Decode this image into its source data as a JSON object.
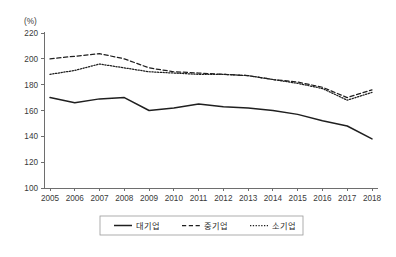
{
  "chart_data": {
    "type": "line",
    "title": "",
    "xlabel": "",
    "ylabel": "(%)",
    "unit_label": "(%)",
    "grid": false,
    "legend_position": "bottom",
    "ylim": [
      100,
      220
    ],
    "yticks": [
      100,
      120,
      140,
      160,
      180,
      200,
      220
    ],
    "ytick_labels": [
      "100",
      "120",
      "140",
      "160",
      "180",
      "200",
      "220"
    ],
    "x": [
      2005,
      2006,
      2007,
      2008,
      2009,
      2010,
      2011,
      2012,
      2013,
      2014,
      2015,
      2016,
      2017,
      2018
    ],
    "xtick_labels": [
      "2005",
      "2006",
      "2007",
      "2008",
      "2009",
      "2010",
      "2011",
      "2012",
      "2013",
      "2014",
      "2015",
      "2016",
      "2017",
      "2018"
    ],
    "series": [
      {
        "name": "대기업",
        "style": "solid",
        "color": "#1f1f1f",
        "values": [
          170,
          166,
          169,
          170,
          160,
          162,
          165,
          163,
          162,
          160,
          157,
          152,
          148,
          138
        ]
      },
      {
        "name": "중기업",
        "style": "dashed",
        "color": "#1f1f1f",
        "values": [
          200,
          202,
          204,
          200,
          193,
          190,
          189,
          188,
          187,
          184,
          182,
          178,
          170,
          176
        ]
      },
      {
        "name": "소기업",
        "style": "dotted",
        "color": "#1f1f1f",
        "values": [
          188,
          191,
          196,
          193,
          190,
          189,
          188,
          188,
          187,
          184,
          181,
          177,
          168,
          174
        ]
      }
    ]
  },
  "legend": {
    "items": [
      {
        "label": "대기업",
        "style": "solid"
      },
      {
        "label": "중기업",
        "style": "dashed"
      },
      {
        "label": "소기업",
        "style": "dotted"
      }
    ]
  }
}
